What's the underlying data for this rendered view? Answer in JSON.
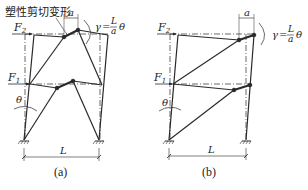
{
  "panels": [
    {
      "id": "a",
      "caption": "(a)",
      "annotation": "塑性剪切变形",
      "force_top": {
        "symbol": "F",
        "sub": "2"
      },
      "force_mid": {
        "symbol": "F",
        "sub": "1"
      },
      "rotation_label": "θ",
      "span_label": "L",
      "link_label": "a",
      "gamma_eq": {
        "lhs": "γ",
        "eq": "=",
        "num": "L",
        "den": "a",
        "rhs": "θ"
      }
    },
    {
      "id": "b",
      "caption": "(b)",
      "force_top": {
        "symbol": "F",
        "sub": "2"
      },
      "force_mid": {
        "symbol": "F",
        "sub": "1"
      },
      "rotation_label": "θ",
      "span_label": "L",
      "link_label": "a",
      "gamma_eq": {
        "lhs": "γ",
        "eq": "=",
        "num": "L",
        "den": "a",
        "rhs": "θ"
      }
    }
  ],
  "colors": {
    "line": "#2a2a2a",
    "dash": "#555555",
    "bg": "#ffffff"
  }
}
